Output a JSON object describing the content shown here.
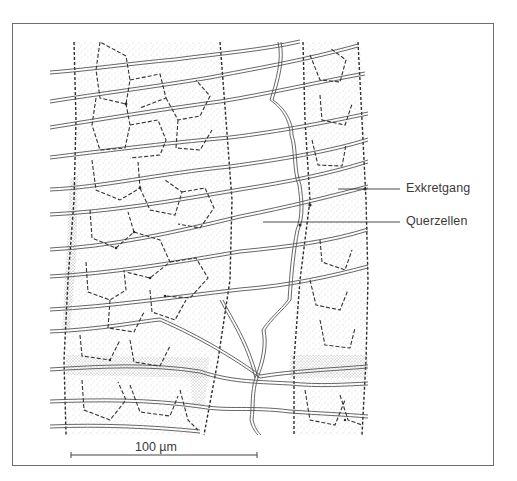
{
  "figure": {
    "type": "histological line drawing",
    "frame_color": "#6e6e6e",
    "line_color": "#4a4a4a",
    "stipple_color": "#8a8a8a",
    "background": "#ffffff"
  },
  "labels": [
    {
      "id": "exkretgang",
      "text": "Exkretgang",
      "leader_from": [
        338,
        189
      ],
      "leader_to": [
        400,
        189
      ]
    },
    {
      "id": "querzellen",
      "text": "Querzellen",
      "leader_from": [
        263,
        222
      ],
      "leader_to": [
        400,
        222
      ]
    }
  ],
  "scale_bar": {
    "label": "100 µm",
    "value": 100,
    "unit": "µm",
    "x_start": 71,
    "x_end": 257,
    "y": 455
  },
  "regions": [
    {
      "id": "left-cell-band",
      "description": "stippled band of polygonal cells (left)"
    },
    {
      "id": "middle-clear-zone",
      "description": "clear zone with elongated transverse cells"
    },
    {
      "id": "right-cell-band",
      "description": "stippled band of polygonal cells (right)"
    }
  ]
}
